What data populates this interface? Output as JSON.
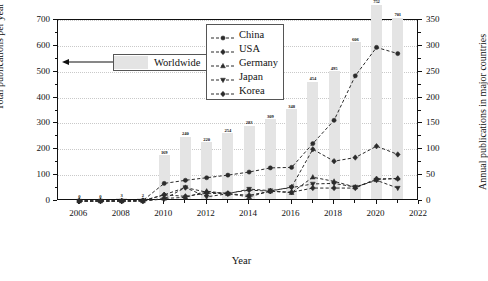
{
  "chart_data": {
    "type": "bar",
    "title": "",
    "subtitle": "",
    "xlabel": "Year",
    "ylabel": "Total publications per year",
    "y2label": "Annual publications in major countries",
    "xlim": [
      2005,
      2022
    ],
    "ylim": [
      0,
      700
    ],
    "y2lim": [
      0,
      350
    ],
    "grid": true,
    "legend_position": "upper-center",
    "x": [
      2006,
      2007,
      2008,
      2009,
      2010,
      2011,
      2012,
      2013,
      2014,
      2015,
      2016,
      2017,
      2018,
      2019,
      2020,
      2021
    ],
    "xticks": [
      "2006",
      "2008",
      "2010",
      "2012",
      "2014",
      "2016",
      "2018",
      "2020",
      "2022"
    ],
    "yticks": [
      "0",
      "100",
      "200",
      "300",
      "400",
      "500",
      "600",
      "700"
    ],
    "y2ticks": [
      "0",
      "50",
      "100",
      "150",
      "200",
      "250",
      "300",
      "350"
    ],
    "bars": {
      "name": "Worldwide",
      "axis": "left",
      "color": "#e4e4e4",
      "values": [
        0,
        0,
        3,
        2,
        169,
        240,
        220,
        254,
        283,
        309,
        348,
        454,
        495,
        606,
        752,
        701
      ],
      "labels": [
        "0",
        "0",
        "3",
        "2",
        "169",
        "240",
        "220",
        "254",
        "283",
        "309",
        "348",
        "454",
        "495",
        "606",
        "752",
        "701"
      ]
    },
    "series": [
      {
        "name": "China",
        "axis": "right",
        "marker": "circle",
        "values": [
          0,
          0,
          0,
          1,
          34,
          40,
          45,
          50,
          56,
          64,
          65,
          111,
          156,
          242,
          297,
          285
        ]
      },
      {
        "name": "USA",
        "axis": "right",
        "marker": "diamond",
        "values": [
          0,
          0,
          0,
          1,
          12,
          26,
          17,
          15,
          21,
          19,
          27,
          100,
          77,
          84,
          106,
          90
        ]
      },
      {
        "name": "Germany",
        "axis": "right",
        "marker": "triangle",
        "values": [
          0,
          0,
          0,
          0,
          5,
          7,
          19,
          14,
          8,
          19,
          16,
          46,
          38,
          27,
          41,
          44
        ]
      },
      {
        "name": "Japan",
        "axis": "right",
        "marker": "triangle-down",
        "values": [
          0,
          0,
          0,
          0,
          4,
          26,
          8,
          14,
          23,
          20,
          26,
          33,
          34,
          27,
          40,
          25
        ]
      },
      {
        "name": "Korea",
        "axis": "right",
        "marker": "diamond",
        "values": [
          0,
          0,
          0,
          0,
          12,
          9,
          15,
          14,
          11,
          19,
          17,
          25,
          25,
          25,
          43,
          43
        ]
      }
    ]
  },
  "annotation": {
    "worldwide_label": "Worldwide"
  },
  "legend": {
    "items": [
      {
        "label": "China"
      },
      {
        "label": "USA"
      },
      {
        "label": "Germany"
      },
      {
        "label": "Japan"
      },
      {
        "label": "Korea"
      }
    ]
  }
}
